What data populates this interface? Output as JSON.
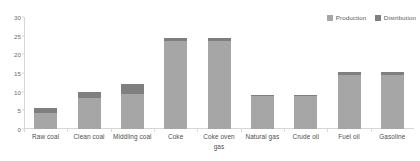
{
  "chart_data": {
    "type": "bar",
    "subtype": "stacked-bar",
    "title": "",
    "subtitle": "",
    "xlabel": "",
    "ylabel": "",
    "ylim": [
      0,
      30
    ],
    "yticks": [
      0,
      5,
      10,
      15,
      20,
      25,
      30
    ],
    "ytick_labels": [
      "0",
      "5",
      "10",
      "15",
      "20",
      "25",
      "30"
    ],
    "grid": false,
    "legend_position": "top-right",
    "categories": [
      "Raw coal",
      "Clean coal",
      "Middling coal",
      "Coke",
      "Coke oven gas",
      "Natural gas",
      "Crude oil",
      "Fuel oil",
      "Gasoline"
    ],
    "series": [
      {
        "name": "Production",
        "color": "#a6a6a6",
        "values": [
          4.2,
          8.4,
          9.3,
          23.6,
          23.6,
          8.8,
          8.8,
          14.4,
          14.6
        ]
      },
      {
        "name": "Distribution",
        "color": "#7f7f7f",
        "values": [
          1.4,
          1.4,
          2.8,
          0.9,
          0.9,
          0.2,
          0.2,
          0.8,
          0.7
        ]
      }
    ],
    "totals": [
      5.6,
      9.8,
      12.1,
      24.5,
      24.5,
      9.0,
      9.0,
      15.2,
      15.3
    ],
    "axis_color": "#d6d6d6",
    "tick_label_color": "#6b6b6b",
    "category_label_color": "#4d4d4d"
  },
  "legend": {
    "items": [
      {
        "label": "Production",
        "color": "#a6a6a6"
      },
      {
        "label": "Distribution",
        "color": "#7f7f7f"
      }
    ]
  }
}
